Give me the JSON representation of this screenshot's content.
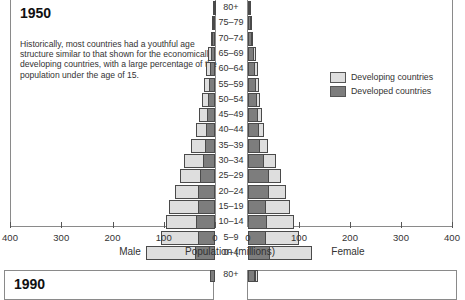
{
  "figure": {
    "title": "1950",
    "description": "Historically, most countries had a youthful age structure similar to that shown for the economically developing countries, with a large percentage of the population under the age of 15.",
    "next_panel_title": "1990",
    "axis_title": "Population (millions)",
    "male_label": "Male",
    "female_label": "Female",
    "legend": [
      {
        "label": "Developing countries",
        "color": "#dedede"
      },
      {
        "label": "Developed countries",
        "color": "#7d7d7d"
      }
    ]
  },
  "chart_data": {
    "type": "bar",
    "subtype": "population-pyramid",
    "title": "1950",
    "xlabel": "Population (millions)",
    "ylabel": "Age group",
    "xlim": [
      0,
      400
    ],
    "x_ticks_male": [
      "400",
      "300",
      "200",
      "100",
      "0"
    ],
    "x_ticks_female": [
      "0",
      "100",
      "200",
      "300",
      "400"
    ],
    "legend_position": "right",
    "grid": false,
    "categories": [
      "80+",
      "75–79",
      "70–74",
      "65–69",
      "60–64",
      "55–59",
      "50–54",
      "45–49",
      "40–44",
      "35–39",
      "30–34",
      "25–29",
      "20–24",
      "15–19",
      "10–14",
      "5–9",
      "0–4"
    ],
    "series": [
      {
        "name": "Male - Developed countries",
        "values": [
          2,
          4,
          6,
          8,
          10,
          12,
          14,
          16,
          18,
          20,
          24,
          30,
          34,
          34,
          38,
          33,
          40
        ]
      },
      {
        "name": "Male - Developing countries (total incl. developed)",
        "values": [
          3,
          5,
          8,
          14,
          18,
          22,
          26,
          32,
          38,
          46,
          60,
          68,
          78,
          90,
          95,
          105,
          135
        ]
      },
      {
        "name": "Female - Developed countries",
        "values": [
          3,
          5,
          8,
          12,
          14,
          16,
          18,
          20,
          22,
          24,
          32,
          40,
          40,
          36,
          38,
          36,
          42
        ]
      },
      {
        "name": "Female - Developing countries (total incl. developed)",
        "values": [
          4,
          6,
          9,
          16,
          20,
          22,
          24,
          28,
          32,
          40,
          55,
          65,
          75,
          82,
          90,
          100,
          125
        ]
      }
    ]
  }
}
